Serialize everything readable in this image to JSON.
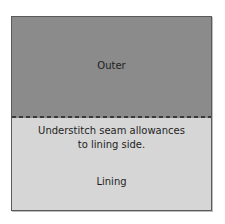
{
  "diagram": {
    "outer_label": "Outer",
    "instruction": "Understitch seam allowances\nto lining side.",
    "lining_label": "Lining",
    "colors": {
      "outer": "#8b8b8b",
      "lining": "#d6d6d6",
      "seam": "#3a3a3a",
      "border": "#5a5a5a"
    }
  }
}
